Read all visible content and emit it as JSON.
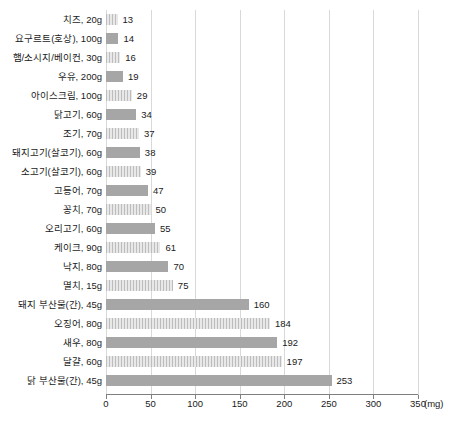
{
  "chart_data": {
    "type": "bar",
    "orientation": "horizontal",
    "title": "",
    "subtitle": "",
    "xlabel": "(mg)",
    "ylabel": "",
    "xlim": [
      0,
      350
    ],
    "xticks": [
      0,
      50,
      100,
      150,
      200,
      250,
      300,
      350
    ],
    "xtick_labels": [
      "0",
      "50",
      "100",
      "150",
      "200",
      "250",
      "300",
      "350"
    ],
    "grid": true,
    "grid_axis": "x",
    "legend": false,
    "legend_position": "none",
    "unit": "(mg)",
    "bar_colors": {
      "solid": "#a6a6a6",
      "striped_base": "#d6d6d6",
      "striped_line": "#bdbdbd",
      "gridline": "#d9d9d9",
      "axis": "#808080",
      "text": "#1a1a1a"
    },
    "categories": [
      "치즈, 20g",
      "요구르트(호상), 100g",
      "햄/소시지/베이컨, 30g",
      "우유, 200g",
      "아이스크림, 100g",
      "닭고기, 60g",
      "조기, 70g",
      "돼지고기(살코기), 60g",
      "소고기(살코기), 60g",
      "고등어, 70g",
      "꽁치, 70g",
      "오리고기, 60g",
      "케이크, 90g",
      "낙지, 80g",
      "멸치, 15g",
      "돼지 부산물(간), 45g",
      "오징어, 80g",
      "새우, 80g",
      "달걀, 60g",
      "닭 부산물(간), 45g"
    ],
    "values": [
      13,
      14,
      16,
      19,
      29,
      34,
      37,
      38,
      39,
      47,
      50,
      55,
      61,
      70,
      75,
      160,
      184,
      192,
      197,
      253
    ],
    "value_labels": [
      "13",
      "14",
      "16",
      "19",
      "29",
      "34",
      "37",
      "38",
      "39",
      "47",
      "50",
      "55",
      "61",
      "70",
      "75",
      "160",
      "184",
      "192",
      "197",
      "253"
    ],
    "bar_styles": [
      "striped",
      "solid",
      "striped",
      "solid",
      "striped",
      "solid",
      "striped",
      "solid",
      "striped",
      "solid",
      "striped",
      "solid",
      "striped",
      "solid",
      "striped",
      "solid",
      "striped",
      "solid",
      "striped",
      "solid"
    ]
  }
}
